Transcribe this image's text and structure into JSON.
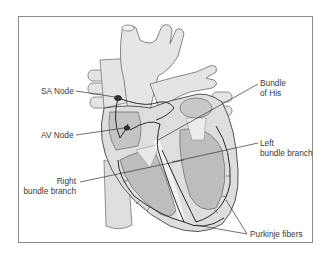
{
  "diagram": {
    "style": "grayscale anatomical illustration",
    "colors": {
      "frame": "#8a8a8a",
      "vessel_fill": "#e4e4e4",
      "chamber_fill": "#bdbdbd",
      "wall_fill": "#dedede",
      "outline": "#555555",
      "conduction_path": "#2a2a2a",
      "leader_line": "#333333",
      "text": "#3a3a3a"
    },
    "labels": {
      "sa_node": "SA Node",
      "av_node": "AV Node",
      "bundle_of_his": {
        "line1": "Bundle",
        "line2": "of His"
      },
      "left_bundle_branch": {
        "line1": "Left",
        "line2": "bundle branch"
      },
      "right_bundle_branch": {
        "line1": "Right",
        "line2": "bundle branch"
      },
      "purkinje_fibers": "Purkinje fibers"
    }
  }
}
